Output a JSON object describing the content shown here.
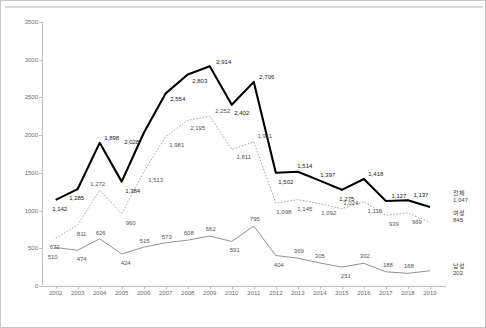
{
  "chart_data": {
    "type": "line",
    "title": "",
    "xlabel": "",
    "ylabel": "",
    "ylim": [
      0,
      3500
    ],
    "ytick_step": 500,
    "grid": false,
    "legend_position": "right",
    "categories": [
      "2002",
      "2003",
      "2004",
      "2005",
      "2006",
      "2007",
      "2008",
      "2009",
      "2010",
      "2011",
      "2012",
      "2013",
      "2014",
      "2015",
      "2016",
      "2017",
      "2018",
      "2019"
    ],
    "series": [
      {
        "name": "전체",
        "end_value": "1,047",
        "style": "solid-thick-black",
        "color": "#000000",
        "values": [
          1142,
          1285,
          1898,
          1384,
          2028,
          2554,
          2803,
          2914,
          2402,
          2706,
          1502,
          1514,
          1397,
          1275,
          1418,
          1127,
          1137,
          1047
        ],
        "labels": [
          "1,142",
          "1,285",
          "1,898",
          "1,384",
          "2,028",
          "2,554",
          "2,803",
          "2,914",
          "2,402",
          "2,706",
          "1,502",
          "1,514",
          "1,397",
          "1,275",
          "1,418",
          "1,127",
          "1,137",
          "1,047"
        ]
      },
      {
        "name": "여성",
        "end_value": "845",
        "style": "dotted-gray",
        "color": "#9a9a9a",
        "values": [
          632,
          811,
          1272,
          960,
          1513,
          1981,
          2195,
          2252,
          1811,
          1911,
          1098,
          1145,
          1092,
          1024,
          1118,
          939,
          969,
          845
        ],
        "labels": [
          "632",
          "811",
          "1,272",
          "960",
          "1,513",
          "1,981",
          "2,195",
          "2,252",
          "1,811",
          "1,911",
          "1,098",
          "1,145",
          "1,092",
          "1,024",
          "1,118",
          "939",
          "969",
          "845"
        ]
      },
      {
        "name": "남성",
        "end_value": "202",
        "style": "solid-thin-gray",
        "color": "#7f7f7f",
        "values": [
          510,
          474,
          626,
          424,
          515,
          573,
          608,
          662,
          591,
          795,
          404,
          369,
          305,
          251,
          302,
          188,
          168,
          202
        ],
        "labels": [
          "510",
          "474",
          "626",
          "424",
          "515",
          "573",
          "608",
          "662",
          "591",
          "795",
          "404",
          "369",
          "305",
          "251",
          "302",
          "188",
          "168",
          "202"
        ]
      }
    ],
    "yticks": [
      "0",
      "500",
      "1000",
      "1500",
      "2000",
      "2500",
      "3000",
      "3500"
    ]
  },
  "legend": {
    "items": [
      {
        "name": "전체",
        "value": "1,047"
      },
      {
        "name": "여성",
        "value": "845"
      },
      {
        "name": "남성",
        "value": "202"
      }
    ]
  }
}
